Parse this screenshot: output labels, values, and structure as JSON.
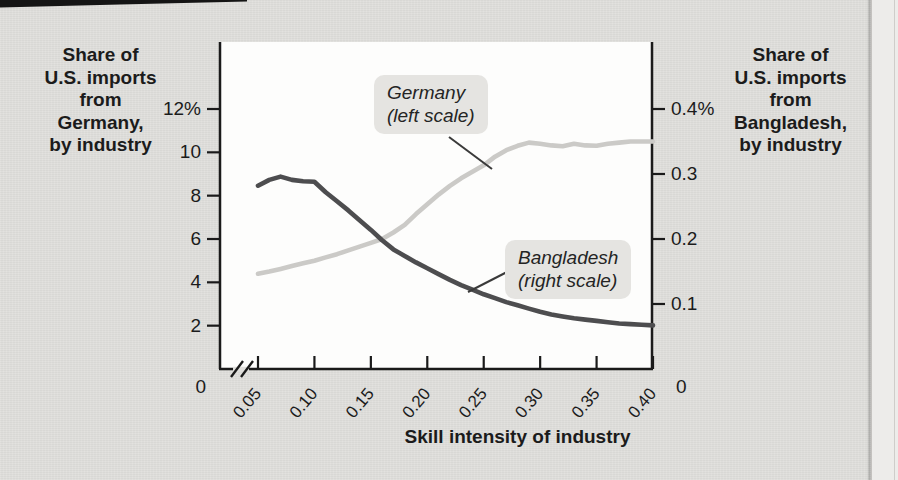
{
  "page": {
    "background_color": "#e0dfdc",
    "paper_edge_color": "#edecea",
    "top_rule_color": "#151515"
  },
  "chart_data": {
    "type": "line",
    "xlabel": "Skill intensity of industry",
    "grid": false,
    "left_axis": {
      "label": "Share of\nU.S. imports\nfrom\nGermany,\nby industry",
      "tick_labels": [
        "12%",
        "10",
        "8",
        "6",
        "4",
        "2"
      ],
      "tick_values": [
        12,
        10,
        8,
        6,
        4,
        2
      ],
      "zero_label": "0",
      "display_range": [
        0,
        15
      ]
    },
    "right_axis": {
      "label": "Share of\nU.S. imports\nfrom\nBangladesh,\nby industry",
      "tick_labels": [
        "0.4%",
        "0.3",
        "0.2",
        "0.1"
      ],
      "tick_values": [
        0.4,
        0.3,
        0.2,
        0.1
      ],
      "zero_label": "0",
      "display_range": [
        0,
        0.5
      ]
    },
    "x_axis": {
      "tick_labels": [
        "0.05",
        "0.10",
        "0.15",
        "0.20",
        "0.25",
        "0.30",
        "0.35",
        "0.40"
      ],
      "tick_values": [
        0.05,
        0.1,
        0.15,
        0.2,
        0.25,
        0.3,
        0.35,
        0.4
      ],
      "plotted_range": [
        0.05,
        0.4
      ],
      "axis_break_before_first_tick": true
    },
    "x": [
      0.05,
      0.06,
      0.07,
      0.08,
      0.09,
      0.1,
      0.11,
      0.12,
      0.13,
      0.14,
      0.15,
      0.16,
      0.17,
      0.18,
      0.19,
      0.2,
      0.21,
      0.22,
      0.23,
      0.24,
      0.25,
      0.26,
      0.27,
      0.28,
      0.29,
      0.3,
      0.31,
      0.32,
      0.33,
      0.34,
      0.35,
      0.36,
      0.37,
      0.38,
      0.39,
      0.4
    ],
    "series": [
      {
        "name": "Germany",
        "scale": "left",
        "color": "#cbcac7",
        "annotation": "Germany\n(left scale)",
        "values": [
          4.4,
          4.5,
          4.62,
          4.75,
          4.88,
          5.0,
          5.15,
          5.3,
          5.48,
          5.65,
          5.82,
          6.0,
          6.3,
          6.65,
          7.15,
          7.6,
          8.05,
          8.45,
          8.8,
          9.1,
          9.4,
          9.8,
          10.1,
          10.3,
          10.45,
          10.4,
          10.32,
          10.28,
          10.4,
          10.32,
          10.3,
          10.4,
          10.45,
          10.5,
          10.5,
          10.5
        ]
      },
      {
        "name": "Bangladesh",
        "scale": "right",
        "color": "#4d4d4f",
        "annotation": "Bangladesh\n(right scale)",
        "values": [
          0.282,
          0.291,
          0.296,
          0.291,
          0.289,
          0.288,
          0.272,
          0.258,
          0.244,
          0.229,
          0.214,
          0.198,
          0.184,
          0.174,
          0.164,
          0.155,
          0.146,
          0.137,
          0.129,
          0.122,
          0.115,
          0.109,
          0.103,
          0.098,
          0.093,
          0.088,
          0.084,
          0.081,
          0.078,
          0.076,
          0.074,
          0.072,
          0.07,
          0.069,
          0.068,
          0.067
        ]
      }
    ],
    "axis_color": "#1a1a1a",
    "plot_background": "#fdfdfc"
  }
}
